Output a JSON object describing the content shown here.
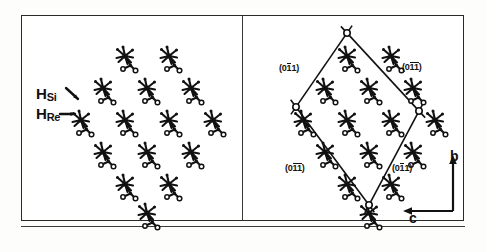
{
  "figure": {
    "type": "crystal-morphology-diagram",
    "background_color": "#ffffff",
    "ink_color": "#111111",
    "panel_count": 2
  },
  "left_panel": {
    "name": "molecular-packing-cluster",
    "description": "Diamond-shaped cluster of molecules",
    "labels": [
      {
        "id": "h-si",
        "base": "H",
        "subscript": "Si",
        "arrow": "down-right"
      },
      {
        "id": "h-re",
        "base": "H",
        "subscript": "Re",
        "arrow": "right"
      }
    ],
    "molecule_rows": [
      {
        "count": 2,
        "y": 41,
        "x_start": 104,
        "x_step": 44
      },
      {
        "count": 3,
        "y": 73,
        "x_start": 82,
        "x_step": 44
      },
      {
        "count": 4,
        "y": 105,
        "x_start": 60,
        "x_step": 44
      },
      {
        "count": 3,
        "y": 137,
        "x_start": 82,
        "x_step": 44
      },
      {
        "count": 2,
        "y": 169,
        "x_start": 104,
        "x_step": 44
      },
      {
        "count": 1,
        "y": 198,
        "x_start": 126,
        "x_step": 44
      }
    ]
  },
  "right_panel": {
    "name": "crystal-habit-with-miller-indices",
    "description": "Same cluster bounded by a rhombic crystal outline with face indices",
    "miller_labels": [
      {
        "id": "face-top-left",
        "prefix": "(0",
        "overbar": "1",
        "suffix": "1)",
        "text": "(011)"
      },
      {
        "id": "face-top-right",
        "prefix": "(0",
        "overbar": "11",
        "suffix": ")",
        "text": "(011)"
      },
      {
        "id": "face-bottom-left",
        "prefix": "(0",
        "overbar": "11",
        "suffix": ")",
        "text": "(011)"
      },
      {
        "id": "face-bottom-right",
        "prefix": "(0",
        "overbar": "1",
        "suffix": "1)",
        "text": "(011)"
      }
    ],
    "axes": [
      {
        "id": "axis-b",
        "label": "b",
        "direction": "up"
      },
      {
        "id": "axis-c",
        "label": "c",
        "direction": "left"
      }
    ],
    "molecule_rows": [
      {
        "count": 2,
        "y": 41,
        "x_start": 104,
        "x_step": 44
      },
      {
        "count": 3,
        "y": 73,
        "x_start": 82,
        "x_step": 44
      },
      {
        "count": 4,
        "y": 105,
        "x_start": 60,
        "x_step": 44
      },
      {
        "count": 3,
        "y": 137,
        "x_start": 82,
        "x_step": 44
      },
      {
        "count": 2,
        "y": 169,
        "x_start": 104,
        "x_step": 44
      },
      {
        "count": 1,
        "y": 198,
        "x_start": 126,
        "x_step": 44
      }
    ]
  }
}
